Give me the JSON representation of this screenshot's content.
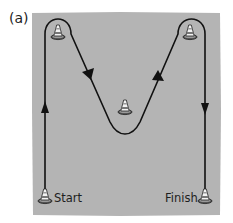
{
  "figure": {
    "panel_label": "(a)",
    "field_color": "#b4b4b4",
    "path_color": "#111111",
    "labels": {
      "start": "Start",
      "finish": "Finish"
    },
    "cones": [
      {
        "id": "start-cone",
        "x": 45,
        "y": 197
      },
      {
        "id": "top-left-cone",
        "x": 58,
        "y": 33
      },
      {
        "id": "middle-cone",
        "x": 125,
        "y": 108
      },
      {
        "id": "top-right-cone",
        "x": 190,
        "y": 33
      },
      {
        "id": "finish-cone",
        "x": 205,
        "y": 197
      }
    ],
    "path_description": "Start up the left side, around the top-left cone, down to around the middle cone, up around the top-right cone, down to Finish"
  }
}
